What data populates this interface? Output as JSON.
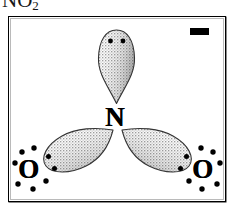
{
  "title": {
    "formula": "NO",
    "subscript": "2"
  },
  "figure": {
    "label": "nitrite-ion-lewis-orbital-diagram",
    "background_color": "#ffffff",
    "line_color": "#000000",
    "lobe_fill_color": "#d8d8d8",
    "lobe_stroke_color": "#3a3a3a",
    "charge_symbol": "−",
    "charge_name": "negative-charge"
  },
  "atoms": [
    {
      "name": "nitrogen",
      "label": "N",
      "x": 118,
      "y": 118
    },
    {
      "name": "oxygen-left",
      "label": "O",
      "x": 30,
      "y": 170
    },
    {
      "name": "oxygen-right",
      "label": "O",
      "x": 204,
      "y": 170
    }
  ],
  "lobes": [
    {
      "name": "lone-pair-lobe-top",
      "direction": "up",
      "electron_dots": 2
    },
    {
      "name": "bonding-lobe-lower-left",
      "direction": "down-left",
      "electron_dots": 2
    },
    {
      "name": "bonding-lobe-lower-right",
      "direction": "down-right",
      "electron_dots": 2
    }
  ],
  "electron_dots": {
    "top_lobe": [
      [
        110,
        41
      ],
      [
        123,
        41
      ]
    ],
    "left_lobe_tip": [
      [
        47,
        157
      ],
      [
        53,
        168
      ]
    ],
    "right_lobe_tip": [
      [
        183,
        157
      ],
      [
        187,
        168
      ]
    ],
    "oxygen_left_around": [
      [
        21,
        152
      ],
      [
        32,
        147
      ],
      [
        15,
        162
      ],
      [
        16,
        182
      ],
      [
        30,
        188
      ],
      [
        42,
        180
      ]
    ],
    "oxygen_right_around": [
      [
        205,
        147
      ],
      [
        217,
        152
      ],
      [
        222,
        162
      ],
      [
        221,
        182
      ],
      [
        207,
        188
      ],
      [
        194,
        180
      ]
    ]
  }
}
